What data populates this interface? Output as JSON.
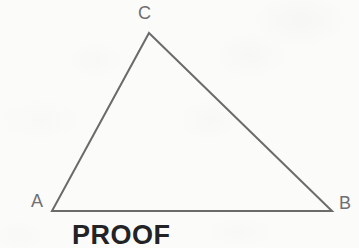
{
  "figure": {
    "type": "geometry-diagram",
    "shape": "triangle",
    "background_color": "#fbfbfa",
    "stroke_color": "#6b6b6b",
    "stroke_width": 2,
    "label_color": "#6f6f72",
    "caption_color": "#232326",
    "vertices": [
      {
        "id": "C",
        "label": "C",
        "x": 149,
        "y": 33
      },
      {
        "id": "A",
        "label": "A",
        "x": 52,
        "y": 211
      },
      {
        "id": "B",
        "label": "B",
        "x": 332,
        "y": 211
      }
    ],
    "edges": [
      {
        "id": "AC",
        "from": "A",
        "to": "C"
      },
      {
        "id": "CB",
        "from": "C",
        "to": "B"
      },
      {
        "id": "AB",
        "from": "A",
        "to": "B"
      }
    ],
    "labels": {
      "vertex_c": "C",
      "vertex_a": "A",
      "vertex_b": "B"
    },
    "caption": "PROOF"
  }
}
